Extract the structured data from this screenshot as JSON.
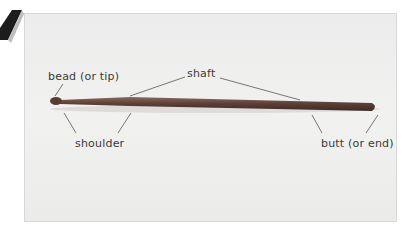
{
  "figure": {
    "labels": {
      "bead": "bead (or tip)",
      "shaft": "shaft",
      "shoulder": "shoulder",
      "butt": "butt (or end)"
    },
    "colors": {
      "background": "#eeeeed",
      "stick": "#6a4a40",
      "label_text": "#3a3a3a",
      "wedge": "#1c1c1c"
    }
  }
}
